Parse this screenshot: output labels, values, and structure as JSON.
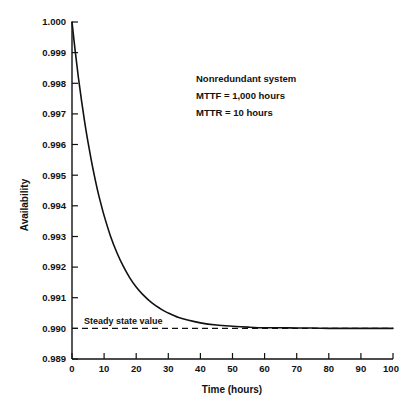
{
  "chart_data": {
    "type": "line",
    "title": "",
    "xlabel": "Time (hours)",
    "ylabel": "Availability",
    "xlim": [
      0,
      100
    ],
    "ylim": [
      0.989,
      1.0
    ],
    "grid": false,
    "legend": null,
    "xticks": [
      "0",
      "10",
      "20",
      "30",
      "40",
      "50",
      "60",
      "70",
      "80",
      "90",
      "100"
    ],
    "xtick_values": [
      0,
      10,
      20,
      30,
      40,
      50,
      60,
      70,
      80,
      90,
      100
    ],
    "yticks": [
      "0.989",
      "0.990",
      "0.991",
      "0.992",
      "0.993",
      "0.994",
      "0.995",
      "0.996",
      "0.997",
      "0.998",
      "0.999",
      "1.000"
    ],
    "ytick_values": [
      0.989,
      0.99,
      0.991,
      0.992,
      0.993,
      0.994,
      0.995,
      0.996,
      0.997,
      0.998,
      0.999,
      1.0
    ],
    "series": [
      {
        "name": "Availability",
        "x": [
          0,
          1,
          2,
          3,
          4,
          5,
          6,
          7,
          8,
          9,
          10,
          12,
          14,
          16,
          18,
          20,
          22,
          25,
          28,
          30,
          33,
          36,
          40,
          45,
          50,
          55,
          60,
          65,
          70,
          75,
          80,
          85,
          90,
          95,
          100
        ],
        "values": [
          1.0,
          0.99905,
          0.99818,
          0.99741,
          0.9967,
          0.99607,
          0.99549,
          0.99497,
          0.99449,
          0.99407,
          0.99368,
          0.99301,
          0.99247,
          0.99202,
          0.99165,
          0.99135,
          0.99111,
          0.99082,
          0.99061,
          0.9905,
          0.99036,
          0.99027,
          0.99018,
          0.99011,
          0.99007,
          0.99004,
          0.99002,
          0.99002,
          0.99001,
          0.99001,
          0.99,
          0.99,
          0.99,
          0.99,
          0.99
        ]
      },
      {
        "name": "Steady state value",
        "x": [
          0,
          100
        ],
        "values": [
          0.99,
          0.99
        ],
        "style": "dashed"
      }
    ],
    "annotations": [
      {
        "text": "Nonredundant system",
        "x": 38,
        "y": 0.9975
      },
      {
        "text": "MTTF  =  1,000 hours",
        "x": 38,
        "y": 0.9966
      },
      {
        "text": "MTTR  =  10 hours",
        "x": 38,
        "y": 0.9957
      },
      {
        "text": "Steady state value",
        "x": 4,
        "y": 0.9903
      }
    ],
    "steady_state_value": 0.99,
    "initial_value": 1.0
  },
  "annotation_text": {
    "line1": "Nonredundant system",
    "line2": "MTTF  =  1,000 hours",
    "line3": "MTTR  =  10 hours",
    "steady": "Steady state value"
  },
  "colors": {
    "background": "#ffffff",
    "ink": "#111111",
    "curve": "#111111"
  }
}
